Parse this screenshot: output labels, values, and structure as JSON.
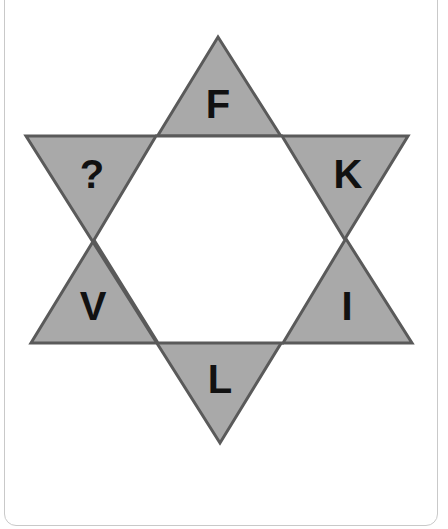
{
  "puzzle": {
    "shape": "six-pointed-star",
    "colors": {
      "point_fill": "#a9a9a9",
      "outline": "#5a5a5a",
      "center_fill": "#ffffff",
      "letter": "#111111",
      "card_border": "#c9c9c9"
    },
    "points": [
      {
        "position": "top",
        "label": "F"
      },
      {
        "position": "upper-right",
        "label": "K"
      },
      {
        "position": "lower-right",
        "label": "I"
      },
      {
        "position": "bottom",
        "label": "L"
      },
      {
        "position": "lower-left",
        "label": "V"
      },
      {
        "position": "upper-left",
        "label": "?"
      }
    ]
  }
}
